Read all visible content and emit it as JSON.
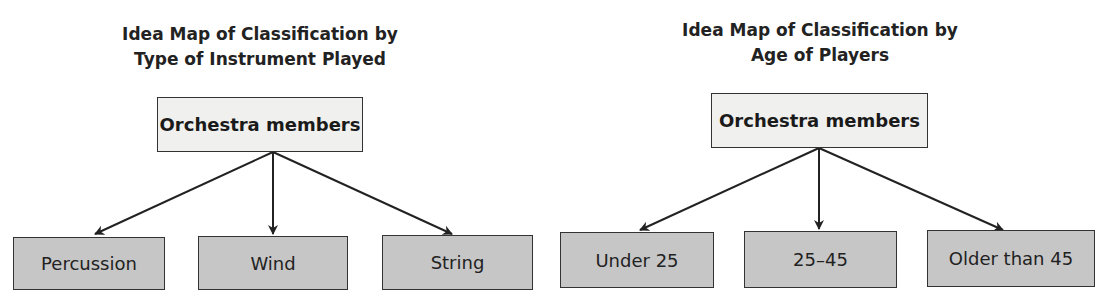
{
  "left_map": {
    "title_line1": "Idea Map of Classification by",
    "title_line2": "Type of Instrument Played",
    "root": "Orchestra members",
    "children": [
      "Percussion",
      "Wind",
      "String"
    ]
  },
  "right_map": {
    "title_line1": "Idea Map of Classification by",
    "title_line2": "Age of Players",
    "root": "Orchestra members",
    "children": [
      "Under 25",
      "25–45",
      "Older than 45"
    ]
  },
  "colors": {
    "root_fill": "#f0f0ee",
    "leaf_fill": "#c6c6c6",
    "stroke": "#333333"
  }
}
